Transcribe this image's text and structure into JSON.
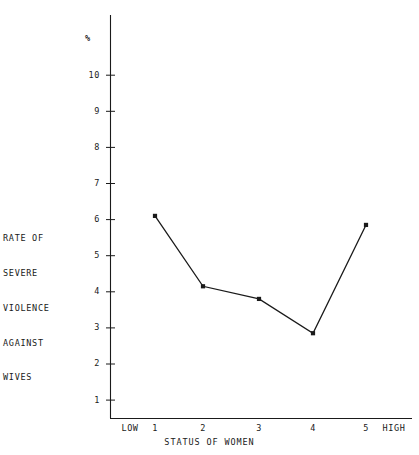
{
  "chart_data": {
    "type": "line",
    "title": "",
    "subtitle": "",
    "xlabel": "STATUS OF WOMEN",
    "ylabel": "RATE OF SEVERE VIOLENCE AGAINST WIVES",
    "unit_label": "%",
    "categories": [
      "1",
      "2",
      "3",
      "4",
      "5"
    ],
    "x": [
      1,
      2,
      3,
      4,
      5
    ],
    "values": [
      6.1,
      4.15,
      3.8,
      2.85,
      5.85
    ],
    "series": [
      {
        "name": "RATE OF SEVERE VIOLENCE AGAINST WIVES",
        "values": [
          6.1,
          4.15,
          3.8,
          2.85,
          5.85
        ]
      }
    ],
    "ylim": [
      0,
      11.2
    ],
    "xlim": [
      0.35,
      5.85
    ],
    "yticks": [
      1,
      2,
      3,
      4,
      5,
      6,
      7,
      8,
      9,
      10
    ],
    "ytick_labels": [
      "1",
      "2",
      "3",
      "4",
      "5",
      "6",
      "7",
      "8",
      "9",
      "10"
    ],
    "xtick_labels": [
      "LOW",
      "1",
      "2",
      "3",
      "4",
      "5",
      "HIGH"
    ],
    "grid": false,
    "legend": false,
    "legend_position": "none",
    "marker": "filled-square",
    "line_color": "#1a1a1a",
    "axis_color": "#1a1a1a",
    "background_color": "#ffffff"
  },
  "axes": {
    "y_label_lines": [
      "RATE OF",
      "SEVERE",
      "VIOLENCE",
      "AGAINST",
      "WIVES"
    ],
    "y_unit": "%",
    "x_title": "STATUS OF WOMEN",
    "x_low_label": "LOW",
    "x_high_label": "HIGH",
    "y_ticks": [
      {
        "label": "10",
        "value": 10
      },
      {
        "label": "9",
        "value": 9
      },
      {
        "label": "8",
        "value": 8
      },
      {
        "label": "7",
        "value": 7
      },
      {
        "label": "6",
        "value": 6
      },
      {
        "label": "5",
        "value": 5
      },
      {
        "label": "4",
        "value": 4
      },
      {
        "label": "3",
        "value": 3
      },
      {
        "label": "2",
        "value": 2
      },
      {
        "label": "1",
        "value": 1
      }
    ],
    "x_ticks": [
      {
        "label": "LOW"
      },
      {
        "label": "1"
      },
      {
        "label": "2"
      },
      {
        "label": "3"
      },
      {
        "label": "4"
      },
      {
        "label": "5"
      },
      {
        "label": "HIGH"
      }
    ]
  }
}
